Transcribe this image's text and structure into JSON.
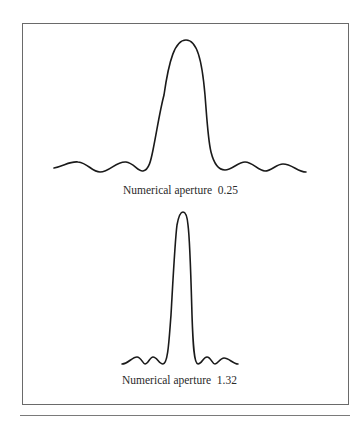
{
  "figure": {
    "panels": [
      {
        "label": "Numerical aperture  0.25",
        "numerical_aperture": 0.25,
        "profile": "broad central peak with side ripples"
      },
      {
        "label": "Numerical aperture  1.32",
        "numerical_aperture": 1.32,
        "profile": "narrow central peak with small side ripples"
      }
    ],
    "colors": {
      "curve": "#1a1a1a",
      "border": "#6a6a6a",
      "text": "#2a2a2a"
    }
  }
}
